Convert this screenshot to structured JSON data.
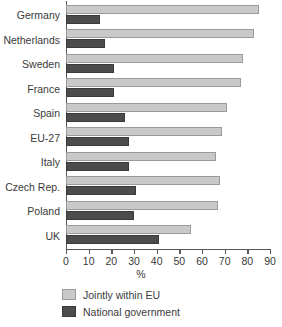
{
  "chart_data": {
    "type": "bar",
    "orientation": "horizontal",
    "title": "",
    "xlabel": "%",
    "ylabel": "",
    "xlim": [
      0,
      90
    ],
    "xticks": [
      0,
      10,
      20,
      30,
      40,
      50,
      60,
      70,
      80,
      90
    ],
    "grid": false,
    "legend_position": "bottom-left",
    "categories": [
      "Germany",
      "Netherlands",
      "Sweden",
      "France",
      "Spain",
      "EU-27",
      "Italy",
      "Czech Rep.",
      "Poland",
      "UK"
    ],
    "series": [
      {
        "name": "Jointly within EU",
        "color": "#c9c9c9",
        "values": [
          85,
          83,
          78,
          77,
          71,
          69,
          66,
          68,
          67,
          55
        ]
      },
      {
        "name": "National government",
        "color": "#4c4c4c",
        "values": [
          15,
          17,
          21,
          21,
          26,
          28,
          28,
          31,
          30,
          41
        ]
      }
    ]
  }
}
